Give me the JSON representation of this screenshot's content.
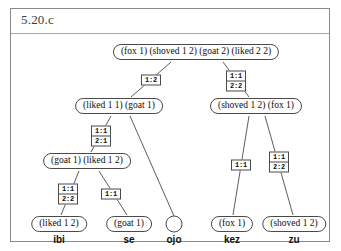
{
  "panel": {
    "title": "5.20.c"
  },
  "tree": {
    "nodes": [
      {
        "id": "root",
        "label": "(fox 1) (shoved 1 2) (goat 2) (liked 2 2)",
        "x": 185,
        "y": 18,
        "empty": false
      },
      {
        "id": "n-l",
        "label": "(liked 1 1) (goat 1)",
        "x": 108,
        "y": 72,
        "empty": false
      },
      {
        "id": "n-r",
        "label": "(shoved 1 2) (fox 1)",
        "x": 245,
        "y": 72,
        "empty": false
      },
      {
        "id": "n-ll",
        "label": "(goat 1) (liked 1 2)",
        "x": 76,
        "y": 127,
        "empty": false
      },
      {
        "id": "leaf-ibi",
        "label": "(liked 1 2)",
        "x": 48,
        "y": 190,
        "empty": false
      },
      {
        "id": "leaf-se",
        "label": "(goat 1)",
        "x": 118,
        "y": 190,
        "empty": false
      },
      {
        "id": "leaf-ojo",
        "label": "",
        "x": 163,
        "y": 190,
        "empty": true
      },
      {
        "id": "leaf-kez",
        "label": "(fox 1)",
        "x": 221,
        "y": 190,
        "empty": false
      },
      {
        "id": "leaf-zu",
        "label": "(shoved 1 2)",
        "x": 283,
        "y": 190,
        "empty": false
      }
    ],
    "edges": [
      {
        "id": "e-root-l",
        "x1": 160,
        "y1": 28,
        "x2": 120,
        "y2": 63
      },
      {
        "id": "e-root-r",
        "x1": 212,
        "y1": 28,
        "x2": 238,
        "y2": 63
      },
      {
        "id": "e-l-ll",
        "x1": 100,
        "y1": 82,
        "x2": 80,
        "y2": 118
      },
      {
        "id": "e-l-ojo",
        "x1": 119,
        "y1": 82,
        "x2": 163,
        "y2": 182
      },
      {
        "id": "e-ll-ibi",
        "x1": 68,
        "y1": 137,
        "x2": 50,
        "y2": 181
      },
      {
        "id": "e-ll-se",
        "x1": 88,
        "y1": 137,
        "x2": 116,
        "y2": 181
      },
      {
        "id": "e-r-kez",
        "x1": 238,
        "y1": 82,
        "x2": 222,
        "y2": 181
      },
      {
        "id": "e-r-zu",
        "x1": 254,
        "y1": 82,
        "x2": 282,
        "y2": 181
      }
    ],
    "edge_labels": [
      {
        "id": "lab-root-l",
        "rows": [
          "1:2"
        ],
        "x": 140,
        "y": 46
      },
      {
        "id": "lab-root-r",
        "rows": [
          "1:1",
          "2:2"
        ],
        "x": 225,
        "y": 47
      },
      {
        "id": "lab-l-ll",
        "rows": [
          "1:1",
          "2:1"
        ],
        "x": 90,
        "y": 102
      },
      {
        "id": "lab-ll-ibi",
        "rows": [
          "1:1",
          "2:2"
        ],
        "x": 57,
        "y": 160
      },
      {
        "id": "lab-ll-se",
        "rows": [
          "1:1"
        ],
        "x": 100,
        "y": 160
      },
      {
        "id": "lab-r-kez",
        "rows": [
          "1:1"
        ],
        "x": 230,
        "y": 131
      },
      {
        "id": "lab-r-zu",
        "rows": [
          "1:1",
          "2:2"
        ],
        "x": 268,
        "y": 128
      }
    ],
    "words": [
      {
        "id": "word-ibi",
        "text": "ibi",
        "x": 48,
        "y": 200
      },
      {
        "id": "word-se",
        "text": "se",
        "x": 118,
        "y": 200
      },
      {
        "id": "word-ojo",
        "text": "ojo",
        "x": 163,
        "y": 200
      },
      {
        "id": "word-kez",
        "text": "kez",
        "x": 221,
        "y": 200
      },
      {
        "id": "word-zu",
        "text": "zu",
        "x": 283,
        "y": 200
      }
    ]
  },
  "colors": {
    "frame": "#8a8a8a",
    "stroke": "#4a4a4a",
    "text": "#0d0d0d",
    "background": "#ffffff"
  }
}
